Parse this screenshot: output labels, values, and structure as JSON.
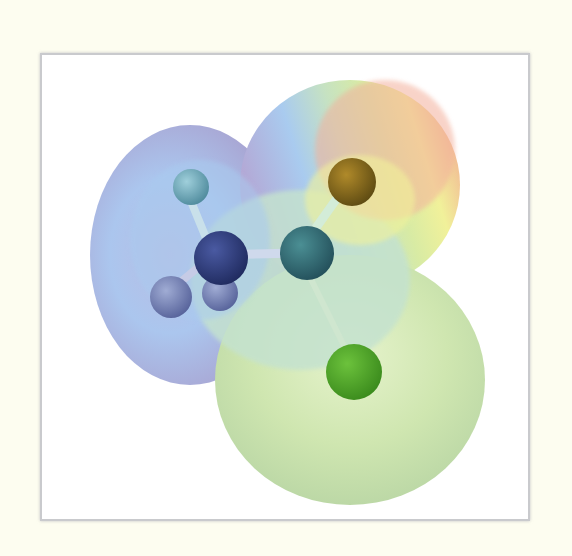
{
  "figure": {
    "molecule_parts": {
      "methyl_group": {
        "atoms": [
          "carbon",
          "hydrogen",
          "hydrogen",
          "hydrogen"
        ]
      },
      "carbonyl_carbon": {
        "atom": "carbon"
      },
      "oxygen": {
        "atom": "oxygen"
      },
      "chlorine": {
        "atom": "chlorine"
      }
    },
    "colors": {
      "background": "#fdfdf0",
      "frame_border": "#c9cacd",
      "surface_blue": "#a9c4ee",
      "surface_violet": "#b3a9d6",
      "surface_green": "#cfe6b0",
      "surface_yellow": "#f2f29a",
      "surface_red": "#f2a795",
      "methyl_carbon": "#2b3a7a",
      "carbonyl_carbon": "#2e6e76",
      "oxygen_atom": "#8a6a1a",
      "chlorine_atom": "#4fa82a",
      "hydrogen_top": "#6fa8b8",
      "hydrogen_bottom": "#6f7fae"
    }
  }
}
